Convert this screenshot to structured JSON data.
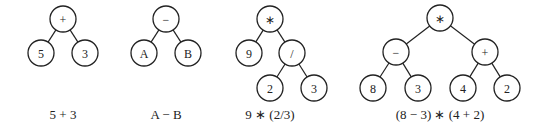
{
  "diagram": {
    "node_radius": 13,
    "trees": [
      {
        "caption": "5 + 3",
        "caption_x": 63,
        "nodes": [
          {
            "id": "t1-root",
            "label": "+",
            "x": 63,
            "y": 19
          },
          {
            "id": "t1-l",
            "label": "5",
            "x": 41,
            "y": 53
          },
          {
            "id": "t1-r",
            "label": "3",
            "x": 85,
            "y": 53
          }
        ],
        "edges": [
          [
            "t1-root",
            "t1-l"
          ],
          [
            "t1-root",
            "t1-r"
          ]
        ]
      },
      {
        "caption": "A − B",
        "caption_x": 166,
        "nodes": [
          {
            "id": "t2-root",
            "label": "−",
            "x": 166,
            "y": 19
          },
          {
            "id": "t2-l",
            "label": "A",
            "x": 144,
            "y": 53
          },
          {
            "id": "t2-r",
            "label": "B",
            "x": 188,
            "y": 53
          }
        ],
        "edges": [
          [
            "t2-root",
            "t2-l"
          ],
          [
            "t2-root",
            "t2-r"
          ]
        ]
      },
      {
        "caption": "9 ∗ (2/3)",
        "caption_x": 270,
        "nodes": [
          {
            "id": "t3-root",
            "label": "∗",
            "x": 270,
            "y": 19
          },
          {
            "id": "t3-l",
            "label": "9",
            "x": 249,
            "y": 53
          },
          {
            "id": "t3-r",
            "label": "/",
            "x": 292,
            "y": 53
          },
          {
            "id": "t3-rl",
            "label": "2",
            "x": 270,
            "y": 88
          },
          {
            "id": "t3-rr",
            "label": "3",
            "x": 314,
            "y": 88
          }
        ],
        "edges": [
          [
            "t3-root",
            "t3-l"
          ],
          [
            "t3-root",
            "t3-r"
          ],
          [
            "t3-r",
            "t3-rl"
          ],
          [
            "t3-r",
            "t3-rr"
          ]
        ]
      },
      {
        "caption": "(8 − 3) ∗ (4 + 2)",
        "caption_x": 440,
        "nodes": [
          {
            "id": "t4-root",
            "label": "∗",
            "x": 440,
            "y": 18
          },
          {
            "id": "t4-l",
            "label": "−",
            "x": 396,
            "y": 52
          },
          {
            "id": "t4-r",
            "label": "+",
            "x": 485,
            "y": 52
          },
          {
            "id": "t4-ll",
            "label": "8",
            "x": 373,
            "y": 88
          },
          {
            "id": "t4-lr",
            "label": "3",
            "x": 418,
            "y": 88
          },
          {
            "id": "t4-rl",
            "label": "4",
            "x": 463,
            "y": 88
          },
          {
            "id": "t4-rr",
            "label": "2",
            "x": 507,
            "y": 88
          }
        ],
        "edges": [
          [
            "t4-root",
            "t4-l"
          ],
          [
            "t4-root",
            "t4-r"
          ],
          [
            "t4-l",
            "t4-ll"
          ],
          [
            "t4-l",
            "t4-lr"
          ],
          [
            "t4-r",
            "t4-rl"
          ],
          [
            "t4-r",
            "t4-rr"
          ]
        ]
      }
    ]
  }
}
